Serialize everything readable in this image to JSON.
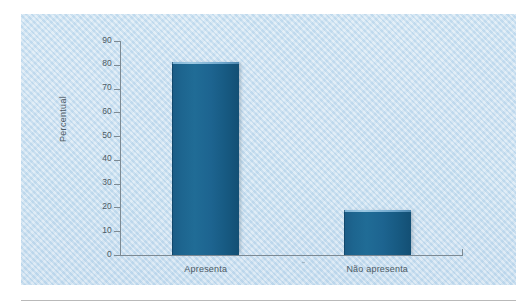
{
  "chart_data": {
    "type": "bar",
    "title": "",
    "subtitle": "",
    "xlabel": "",
    "ylabel": "Percentual",
    "categories": [
      "Apresenta",
      "Não apresenta"
    ],
    "values": [
      81,
      19
    ],
    "series": [
      {
        "name": "Percentual",
        "values": [
          81,
          19
        ]
      }
    ],
    "ylim": [
      0,
      90
    ],
    "ytick_values": [
      0,
      10,
      20,
      30,
      40,
      50,
      60,
      70,
      80,
      90
    ],
    "ytick_labels": [
      "0",
      "10",
      "20",
      "30",
      "40",
      "50",
      "60",
      "70",
      "80",
      "90"
    ],
    "grid": false,
    "legend": false,
    "legend_position": "none",
    "bar_color": "#1d6490",
    "panel_background_color": "#cbe0f0",
    "axis_color": "#7d8a93",
    "text_color": "#4d5a64"
  }
}
